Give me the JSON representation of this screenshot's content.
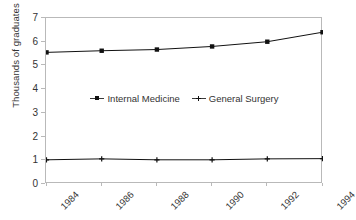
{
  "chart_data": {
    "type": "line",
    "title": "",
    "xlabel": "",
    "ylabel": "Thousands of graduates",
    "categories": [
      "1984",
      "1986",
      "1988",
      "1990",
      "1992",
      "1994"
    ],
    "x": [
      1984,
      1986,
      1988,
      1990,
      1992,
      1994
    ],
    "series": [
      {
        "name": "Internal Medicine",
        "marker": "square",
        "color": "#111111",
        "values": [
          5.55,
          5.62,
          5.67,
          5.8,
          6.0,
          6.4
        ]
      },
      {
        "name": "General Surgery",
        "marker": "plus",
        "color": "#111111",
        "values": [
          1.02,
          1.06,
          1.02,
          1.02,
          1.06,
          1.07
        ]
      }
    ],
    "ylim": [
      0,
      7
    ],
    "yticks": [
      0,
      1,
      2,
      3,
      4,
      5,
      6,
      7
    ],
    "ytick_labels": [
      "0",
      "1",
      "2",
      "3",
      "4",
      "5",
      "6",
      "7"
    ],
    "grid": false,
    "legend_position": "center-inside",
    "xtick_rotation": -45,
    "frame_color": "#b9b9b9",
    "background": "#ffffff"
  }
}
